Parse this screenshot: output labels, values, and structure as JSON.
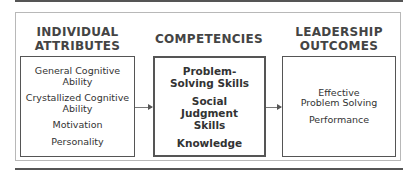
{
  "columns": [
    {
      "heading": "INDIVIDUAL ATTRIBUTES",
      "heading_lines": [
        "INDIVIDUAL",
        "ATTRIBUTES"
      ],
      "items": [
        "General Cognitive Ability",
        "Crystallized Cognitive Ability",
        "Motivation",
        "Personality"
      ]
    },
    {
      "heading": "COMPETENCIES",
      "heading_lines": [
        "COMPETENCIES"
      ],
      "items": [
        "Problem-Solving Skills",
        "Social Judgment Skills",
        "Knowledge"
      ]
    },
    {
      "heading": "LEADERSHIP OUTCOMES",
      "heading_lines": [
        "LEADERSHIP",
        "OUTCOMES"
      ],
      "items": [
        "Effective Problem Solving",
        "Performance"
      ]
    }
  ],
  "arrows": [
    {
      "from": "INDIVIDUAL ATTRIBUTES",
      "to": "COMPETENCIES"
    },
    {
      "from": "COMPETENCIES",
      "to": "LEADERSHIP OUTCOMES"
    }
  ],
  "colors": {
    "border": "#555555",
    "outer_border": "#b8b8b8",
    "text": "#333333"
  }
}
